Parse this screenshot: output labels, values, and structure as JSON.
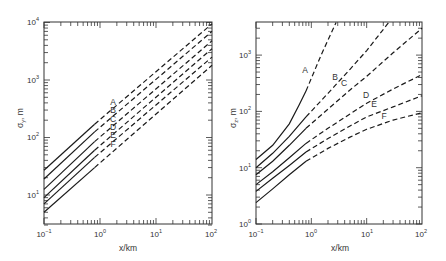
{
  "chart_data": [
    {
      "type": "line",
      "panel": "left",
      "title": "",
      "xlabel": "x/km",
      "ylabel": "σy, m",
      "xscale": "log",
      "yscale": "log",
      "xlim": [
        0.1,
        100
      ],
      "ylim": [
        3,
        10000
      ],
      "x_ticks": [
        "10^-1",
        "10^0",
        "10^1",
        "10^2"
      ],
      "y_ticks": [
        "10^1",
        "10^2",
        "10^3",
        "10^4"
      ],
      "grid": false,
      "solid_until_x": 0.8,
      "note": "solid line up to ~0.8 km, dashed beyond",
      "x": [
        0.1,
        0.8,
        100
      ],
      "series": [
        {
          "name": "A",
          "values": [
            27,
            170,
            9500
          ]
        },
        {
          "name": "B",
          "values": [
            19,
            125,
            7000
          ]
        },
        {
          "name": "C",
          "values": [
            12.5,
            85,
            4800
          ]
        },
        {
          "name": "D",
          "values": [
            9,
            60,
            3500
          ]
        },
        {
          "name": "E",
          "values": [
            7,
            45,
            2500
          ]
        },
        {
          "name": "F",
          "values": [
            5,
            30,
            1800
          ]
        }
      ],
      "labels": [
        {
          "text": "A",
          "px": [
            113,
            102
          ]
        },
        {
          "text": "B",
          "px": [
            113,
            110
          ]
        },
        {
          "text": "C",
          "px": [
            113,
            119
          ]
        },
        {
          "text": "D",
          "px": [
            113,
            127
          ]
        },
        {
          "text": "E",
          "px": [
            113,
            135
          ]
        },
        {
          "text": "F",
          "px": [
            113,
            144
          ]
        }
      ]
    },
    {
      "type": "line",
      "panel": "right",
      "title": "",
      "xlabel": "x/km",
      "ylabel": "σz, m",
      "xscale": "log",
      "yscale": "log",
      "xlim": [
        0.1,
        100
      ],
      "ylim": [
        1,
        3800
      ],
      "x_ticks": [
        "10^-1",
        "10^0",
        "10^1",
        "10^2"
      ],
      "y_ticks": [
        "10^0",
        "10^1",
        "10^2",
        "10^3"
      ],
      "grid": false,
      "solid_until_x": 0.8,
      "note": "solid line up to ~0.8 km, dashed beyond",
      "series": [
        {
          "name": "A",
          "x": [
            0.1,
            0.2,
            0.4,
            0.6,
            0.8,
            1.5,
            2.8
          ],
          "values": [
            14,
            25,
            60,
            130,
            230,
            1000,
            3800
          ]
        },
        {
          "name": "B",
          "x": [
            0.1,
            0.2,
            0.4,
            0.8,
            2,
            5,
            10,
            25
          ],
          "values": [
            10,
            18,
            36,
            80,
            210,
            560,
            1200,
            3800
          ]
        },
        {
          "name": "C",
          "x": [
            0.1,
            0.2,
            0.4,
            0.8,
            2,
            5,
            10,
            30,
            100
          ],
          "values": [
            7.5,
            13,
            25,
            50,
            110,
            240,
            420,
            1100,
            3000
          ]
        },
        {
          "name": "D",
          "x": [
            0.1,
            0.2,
            0.4,
            0.8,
            2,
            5,
            10,
            30,
            100
          ],
          "values": [
            5,
            8.5,
            15,
            27,
            50,
            90,
            140,
            250,
            450
          ]
        },
        {
          "name": "E",
          "x": [
            0.1,
            0.2,
            0.4,
            0.8,
            2,
            5,
            10,
            30,
            100
          ],
          "values": [
            3.8,
            6.5,
            11,
            19,
            33,
            55,
            80,
            120,
            190
          ]
        },
        {
          "name": "F",
          "x": [
            0.1,
            0.2,
            0.4,
            0.8,
            2,
            5,
            10,
            30,
            100
          ],
          "values": [
            2.4,
            4.2,
            7.5,
            13,
            22,
            35,
            48,
            70,
            95
          ]
        }
      ],
      "labels": [
        {
          "text": "A",
          "px": [
            305,
            70
          ]
        },
        {
          "text": "B",
          "px": [
            335,
            77
          ]
        },
        {
          "text": "C",
          "px": [
            344,
            83
          ]
        },
        {
          "text": "D",
          "px": [
            366,
            95
          ]
        },
        {
          "text": "E",
          "px": [
            374,
            104
          ]
        },
        {
          "text": "F",
          "px": [
            384,
            116
          ]
        }
      ]
    }
  ],
  "panels": {
    "left": {
      "xlabel": "x/km",
      "ylabel_main": "σ",
      "ylabel_sub": "y",
      "ylabel_unit": ", m",
      "x_tick_bases": [
        "10",
        "10",
        "10",
        "10"
      ],
      "x_tick_exps": [
        "−1",
        "0",
        "1",
        "2"
      ],
      "y_tick_bases": [
        "10",
        "10",
        "10",
        "10"
      ],
      "y_tick_exps": [
        "1",
        "2",
        "3",
        "4"
      ]
    },
    "right": {
      "xlabel": "x/km",
      "ylabel_main": "σ",
      "ylabel_sub": "z",
      "ylabel_unit": ", m",
      "x_tick_bases": [
        "10",
        "10",
        "10",
        "10"
      ],
      "x_tick_exps": [
        "−1",
        "0",
        "1",
        "2"
      ],
      "y_tick_bases": [
        "10",
        "10",
        "10",
        "10"
      ],
      "y_tick_exps": [
        "0",
        "1",
        "2",
        "3"
      ]
    }
  },
  "colors": {
    "line": "#1a1a1a",
    "frame": "#333333",
    "text": "#333333"
  }
}
